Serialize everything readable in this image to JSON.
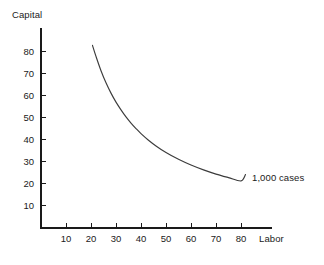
{
  "chart_data": {
    "type": "line",
    "title": "",
    "subtitle": "",
    "xlabel": "Labor",
    "ylabel": "Capital",
    "xlim": [
      0,
      92.4
    ],
    "ylim": [
      0,
      90.9
    ],
    "xticks": [
      10,
      20,
      30,
      40,
      50,
      60,
      70,
      80
    ],
    "yticks": [
      10,
      20,
      30,
      40,
      50,
      60,
      70,
      80
    ],
    "xtick_labels": [
      "10",
      "20",
      "30",
      "40",
      "50",
      "60",
      "70",
      "80"
    ],
    "ytick_labels": [
      "10",
      "20",
      "30",
      "40",
      "50",
      "60",
      "70",
      "80"
    ],
    "grid": false,
    "legend": "none",
    "annotations": [
      {
        "text": "1,000 cases",
        "x": 86,
        "y": 24,
        "anchor": "left"
      }
    ],
    "series": [
      {
        "name": "1,000 cases",
        "color": "#3c3c3c",
        "x": [
          20.6,
          22,
          24,
          26,
          28,
          30,
          32,
          34,
          36,
          38,
          40,
          43,
          46,
          50,
          55,
          60,
          65,
          70,
          75,
          80,
          81.8
        ],
        "y": [
          83.0,
          78.0,
          71.5,
          66.0,
          61.3,
          57.2,
          53.7,
          50.5,
          47.7,
          45.2,
          42.9,
          39.9,
          37.3,
          34.3,
          31.2,
          28.6,
          26.4,
          24.5,
          22.9,
          21.4,
          24.3
        ],
        "curve_formula": "K = 1715 / L",
        "description": "Downward-sloping convex isoquant for 1,000 cases of output"
      }
    ]
  },
  "axes": {
    "y_axis_title": "Capital",
    "x_axis_title": "Labor",
    "axis_color": "#1a1a1a"
  },
  "labels": {
    "curve_label": "1,000 cases"
  },
  "colors": {
    "background": "#ffffff",
    "axis": "#1a1a1a",
    "curve": "#3c3c3c",
    "text": "#1a1a1a"
  }
}
